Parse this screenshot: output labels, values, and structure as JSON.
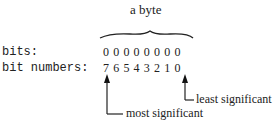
{
  "title": "a byte",
  "rows": {
    "bits_label": "bits:",
    "bits_values": "00000000",
    "bit_numbers_label": "bit numbers:",
    "bit_numbers_values": "76543210"
  },
  "annotations": {
    "msb": "most significant",
    "lsb": "least significant"
  }
}
